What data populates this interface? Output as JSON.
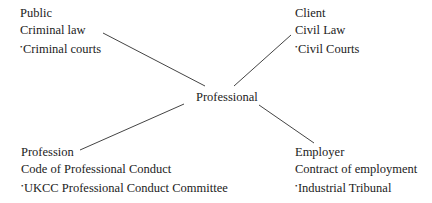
{
  "center": {
    "label": "Professional"
  },
  "nodes": [
    {
      "id": "public",
      "lines": [
        "Public",
        "Criminal law",
        "Criminal courts"
      ],
      "marker": "•"
    },
    {
      "id": "client",
      "lines": [
        "Client",
        "Civil Law",
        "Civil Courts"
      ],
      "marker": "•"
    },
    {
      "id": "profession",
      "lines": [
        "Profession",
        "Code of Professional Conduct",
        "UKCC Professional Conduct Committee"
      ],
      "marker": "•"
    },
    {
      "id": "employer",
      "lines": [
        "Employer",
        "Contract of employment",
        "Industrial Tribunal"
      ],
      "marker": "•"
    }
  ],
  "connectors": [
    {
      "from": "center",
      "to": "public"
    },
    {
      "from": "center",
      "to": "client"
    },
    {
      "from": "center",
      "to": "profession"
    },
    {
      "from": "center",
      "to": "employer"
    }
  ]
}
